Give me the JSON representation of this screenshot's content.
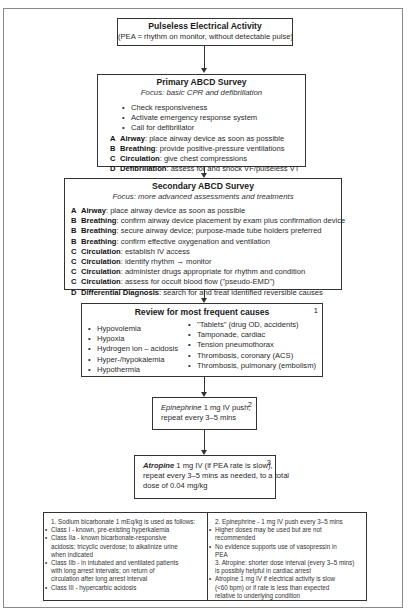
{
  "pea": {
    "title": "Pulseless Electrical Activity",
    "subtitle": "(PEA = rhythm on monitor, without detectable pulse)"
  },
  "primary": {
    "title": "Primary ABCD Survey",
    "focus": "Focus: basic CPR and defibrillation",
    "bullets": [
      "Check responsiveness",
      "Activate emergency response system",
      "Call for defibrillator"
    ],
    "steps": [
      {
        "letter": "A",
        "term": "Airway",
        "text": ": place airway device as soon as possible"
      },
      {
        "letter": "B",
        "term": "Breathing",
        "text": ": provide positive-pressure ventilations"
      },
      {
        "letter": "C",
        "term": "Circulation",
        "text": ": give chest compressions"
      },
      {
        "letter": "D",
        "term": "Defibrillation",
        "text": ": assess for and shock VF/pulseless VT"
      }
    ]
  },
  "secondary": {
    "title": "Secondary ABCD Survey",
    "focus": "Focus: more advanced assessments and treatments",
    "steps": [
      {
        "letter": "A",
        "term": "Airway",
        "text": ": place airway device as soon as possible"
      },
      {
        "letter": "B",
        "term": "Breathing",
        "text": ": confirm airway device placement by exam plus confirmation device"
      },
      {
        "letter": "B",
        "term": "Breathing",
        "text": ": secure airway device; purpose-made tube holders preferred"
      },
      {
        "letter": "B",
        "term": "Breathing",
        "text": ": confirm effective oxygenation and ventilation"
      },
      {
        "letter": "C",
        "term": "Circulation",
        "text": ": establish IV access"
      },
      {
        "letter": "C",
        "term": "Circulation",
        "text": ": identify rhythm → monitor"
      },
      {
        "letter": "C",
        "term": "Circulation",
        "text": ": administer drugs appropriate for rhythm and condition"
      },
      {
        "letter": "C",
        "term": "Circulation",
        "text": ": assess for occult blood flow (\"pseudo-EMD\")"
      },
      {
        "letter": "D",
        "term": "Differential Diagnosis",
        "text": ": search for and treat identified reversible causes"
      }
    ]
  },
  "review": {
    "title": "Review for most frequent causes",
    "number": "1",
    "left": [
      "Hypovolemia",
      "Hypoxia",
      "Hydrogen ion – acidosis",
      "Hyper-/hypokalemia",
      "Hypothermia"
    ],
    "right": [
      "\"Tablets\" (drug OD, accidents)",
      "Tamponade, cardiac",
      "Tension pneumothorax",
      "Thrombosis, coronary (ACS)",
      "Thrombosis, pulmonary (embolism)"
    ]
  },
  "epinephrine": {
    "number": "2",
    "drug": "Epinephrine",
    "line1": " 1 mg IV push,",
    "line2": "repeat every 3–5 mins"
  },
  "atropine": {
    "number": "3",
    "drug": "Atropine",
    "line1": " 1 mg IV (if PEA rate is slow),",
    "line2": "repeat every 3–5 mins as needed, to a total",
    "line3": "dose of 0.04 mg/kg"
  },
  "notes_left": {
    "heading": "1.  Sodium bicarbonate 1 mEq/kg is used as follows:",
    "items": [
      [
        "Class I - known, pre-existing hyperkalemia"
      ],
      [
        "Class IIa - known bicarbonate-responsive",
        "acidosis; tricyclic overdose; to alkalinize urine",
        "when indicated"
      ],
      [
        "Class IIb - in intubated and ventilated patients",
        "with long arrest intervals; on return of",
        "circulation after long arrest interval"
      ],
      [
        "Class III - hypercarbic acidosis"
      ]
    ]
  },
  "notes_right": {
    "heading1": "2.  Epinephrine - 1 mg IV push every 3–5 mins",
    "items1": [
      [
        "Higher doses may be used but are not",
        "recommended"
      ],
      [
        "No evidence supports use of vasopressin in",
        "PEA"
      ]
    ],
    "heading2a": "3.  Atropine: shorter dose interval (every 3–5 mins)",
    "heading2b": "is possibly helpful in cardiac arrest",
    "items2": [
      [
        "Atropine 1 mg IV if electrical activity is slow",
        "(<60 bpm) or if rate is less than expected",
        "relative to underlying condition"
      ]
    ]
  }
}
